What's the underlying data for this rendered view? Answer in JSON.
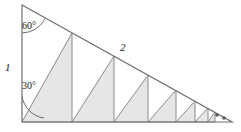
{
  "figure": {
    "kind": "geometry-diagram",
    "background_color": "#ffffff",
    "stroke_color": "#6f6f6f",
    "fill_color": "#e6e6e6",
    "labels": {
      "leg_vertical": "1",
      "hypotenuse": "2",
      "angle_top": "60°",
      "angle_bottom": "30°"
    },
    "continuation_dots": {
      "name": "ellipsis-dots",
      "count": 2,
      "color": "#5a5a5a"
    },
    "outer_triangle": {
      "apex": [
        22,
        5
      ],
      "bottom_left": [
        22,
        122
      ],
      "bottom_right": [
        232,
        122
      ]
    },
    "angle_arcs": [
      {
        "name": "angle-arc-60",
        "vertex": [
          22,
          5
        ],
        "value": "60°"
      },
      {
        "name": "angle-arc-30",
        "vertex": [
          22,
          122
        ],
        "value": "30°"
      }
    ],
    "inner_triangles": [
      {
        "index": 1,
        "left_x": 22,
        "right_x": 72,
        "apex_y": 33,
        "shaded": true
      },
      {
        "index": 2,
        "left_x": 72,
        "right_x": 114,
        "apex_y": 56,
        "shaded": true
      },
      {
        "index": 3,
        "left_x": 114,
        "right_x": 148,
        "apex_y": 75,
        "shaded": true
      },
      {
        "index": 4,
        "left_x": 148,
        "right_x": 176,
        "apex_y": 90,
        "shaded": true
      },
      {
        "index": 5,
        "left_x": 176,
        "right_x": 195,
        "apex_y": 101,
        "shaded": true
      },
      {
        "index": 6,
        "left_x": 195,
        "right_x": 208,
        "apex_y": 108,
        "shaded": true
      },
      {
        "index": 7,
        "left_x": 208,
        "right_x": 215,
        "apex_y": 112,
        "shaded": true
      }
    ]
  }
}
